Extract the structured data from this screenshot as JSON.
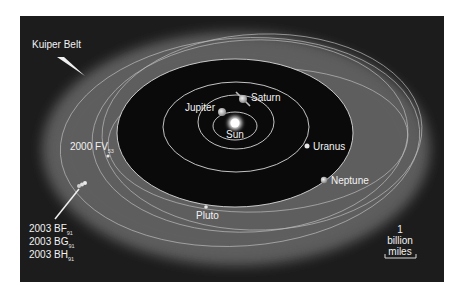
{
  "figure": {
    "type": "solar-system-orbit-diagram",
    "colors": {
      "page_background": "#ffffff",
      "space_background": "#1c1c1c",
      "kuiper_belt": "#5c5c5c",
      "inner_region": "#0a0a0a",
      "orbit_line": "#d8d8d8",
      "label_text": "#f2f2f2"
    }
  },
  "labels": {
    "kuiper_belt": "Kuiper Belt",
    "sun": "Sun",
    "jupiter": "Jupiter",
    "saturn": "Saturn",
    "uranus": "Uranus",
    "neptune": "Neptune",
    "pluto": "Pluto",
    "fv53": {
      "main": "2000 FV",
      "sub": "53"
    },
    "kbo_group": [
      {
        "main": "2003 BF",
        "sub": "91"
      },
      {
        "main": "2003 BG",
        "sub": "91"
      },
      {
        "main": "2003 BH",
        "sub": "91"
      }
    ]
  },
  "scale_bar": {
    "line1": "1",
    "line2": "billion",
    "line3": "miles"
  }
}
